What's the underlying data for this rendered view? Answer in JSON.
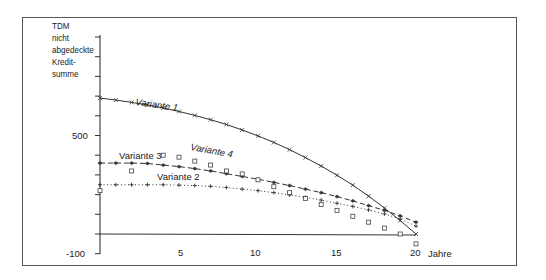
{
  "chart_data": {
    "type": "line",
    "title": "",
    "ylabel": "TDM nicht abgedeckte Kredit- summe",
    "ylabel_lines": [
      "TDM",
      "nicht",
      "abgedeckte",
      "Kredit-",
      "summe"
    ],
    "xlabel": "Jahre",
    "x_ticks": [
      5,
      10,
      15,
      20
    ],
    "y_tick_labels": [
      {
        "value": 500,
        "label": "500"
      },
      {
        "value": -100,
        "label": "-100"
      }
    ],
    "ylim": [
      -100,
      1000
    ],
    "xlim": [
      0,
      20
    ],
    "grid": false,
    "legend": "inline labels",
    "x": [
      0,
      1,
      2,
      3,
      4,
      5,
      6,
      7,
      8,
      9,
      10,
      11,
      12,
      13,
      14,
      15,
      16,
      17,
      18,
      19,
      20
    ],
    "series": [
      {
        "name": "Variante 1",
        "marker": "x",
        "line": "solid",
        "values": [
          690,
          680,
          668,
          655,
          640,
          622,
          602,
          580,
          556,
          528,
          498,
          465,
          428,
          388,
          345,
          298,
          248,
          192,
          132,
          68,
          0
        ]
      },
      {
        "name": "Variante 3",
        "marker": "diamond/filled",
        "line": "dashed",
        "values": [
          360,
          360,
          360,
          358,
          350,
          342,
          332,
          320,
          306,
          292,
          278,
          262,
          246,
          228,
          210,
          190,
          168,
          144,
          120,
          92,
          60
        ]
      },
      {
        "name": "Variante 2",
        "marker": "+",
        "line": "dotted",
        "values": [
          250,
          250,
          250,
          250,
          250,
          248,
          246,
          242,
          236,
          228,
          220,
          210,
          198,
          186,
          172,
          156,
          140,
          122,
          102,
          76,
          40
        ]
      },
      {
        "name": "Variante 4",
        "marker": "square",
        "line": "none",
        "values": [
          220,
          null,
          320,
          null,
          400,
          390,
          370,
          350,
          320,
          305,
          275,
          240,
          210,
          180,
          150,
          120,
          90,
          60,
          30,
          0,
          -50
        ]
      }
    ],
    "annotations": [
      {
        "text": "Variante 1",
        "x": 5.5,
        "y": 720
      },
      {
        "text": "Variante 4",
        "x": 6.5,
        "y": 410
      },
      {
        "text": "Variante 3",
        "x": 2.5,
        "y": 370
      },
      {
        "text": "Variante 2",
        "x": 5.5,
        "y": 280
      }
    ]
  },
  "axis": {
    "x_labels": [
      "5",
      "10",
      "15",
      "20"
    ],
    "x_title": "Jahre",
    "y_label_500": "500",
    "y_label_m100": "-100"
  },
  "labels": {
    "v1": "Variante 1",
    "v2": "Variante 2",
    "v3": "Variante 3",
    "v4": "Variante 4"
  }
}
